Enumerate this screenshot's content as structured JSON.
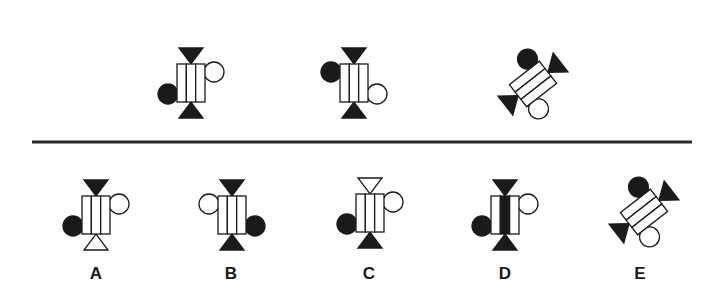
{
  "puzzle": {
    "question_figures": [
      {
        "id": "q1",
        "orientation": "upright",
        "stripes": [
          "white",
          "white",
          "white"
        ],
        "top_triangle": "black",
        "bottom_triangle": "black",
        "left_circle": {
          "color": "black",
          "position": "lower"
        },
        "right_circle": {
          "color": "white",
          "position": "upper"
        }
      },
      {
        "id": "q2",
        "orientation": "upright",
        "stripes": [
          "white",
          "white",
          "white"
        ],
        "top_triangle": "black",
        "bottom_triangle": "black",
        "left_circle": {
          "color": "black",
          "position": "upper"
        },
        "right_circle": {
          "color": "white",
          "position": "lower"
        }
      },
      {
        "id": "q3",
        "orientation": "tilted",
        "stripes": [
          "white",
          "white",
          "white"
        ],
        "top_triangle": "black",
        "bottom_triangle": "black",
        "left_circle": {
          "color": "black",
          "position": "upper"
        },
        "right_circle": {
          "color": "white",
          "position": "lower"
        }
      }
    ],
    "options": [
      {
        "label": "A",
        "orientation": "upright",
        "stripes": [
          "white",
          "white",
          "white"
        ],
        "top_triangle": "black",
        "bottom_triangle": "white",
        "left_circle": {
          "color": "black",
          "position": "lower"
        },
        "right_circle": {
          "color": "white",
          "position": "upper"
        }
      },
      {
        "label": "B",
        "orientation": "upright",
        "stripes": [
          "white",
          "white",
          "white"
        ],
        "top_triangle": "black",
        "bottom_triangle": "black",
        "left_circle": {
          "color": "white",
          "position": "upper"
        },
        "right_circle": {
          "color": "black",
          "position": "lower"
        }
      },
      {
        "label": "C",
        "orientation": "upright",
        "stripes": [
          "white",
          "white",
          "white"
        ],
        "top_triangle": "white",
        "bottom_triangle": "black",
        "left_circle": {
          "color": "black",
          "position": "lower"
        },
        "right_circle": {
          "color": "white",
          "position": "upper"
        }
      },
      {
        "label": "D",
        "orientation": "upright",
        "stripes": [
          "white",
          "black",
          "white"
        ],
        "top_triangle": "black",
        "bottom_triangle": "black",
        "left_circle": {
          "color": "black",
          "position": "lower"
        },
        "right_circle": {
          "color": "white",
          "position": "upper"
        }
      },
      {
        "label": "E",
        "orientation": "tilted",
        "stripes": [
          "white",
          "white",
          "white"
        ],
        "top_triangle": "black",
        "bottom_triangle": "black",
        "left_circle": {
          "color": "black",
          "position": "upper"
        },
        "right_circle": {
          "color": "white",
          "position": "lower"
        }
      }
    ]
  },
  "colors": {
    "black": "#1a1a1a",
    "white": "#ffffff",
    "stroke": "#1a1a1a",
    "divider": "#2a2a2a"
  }
}
